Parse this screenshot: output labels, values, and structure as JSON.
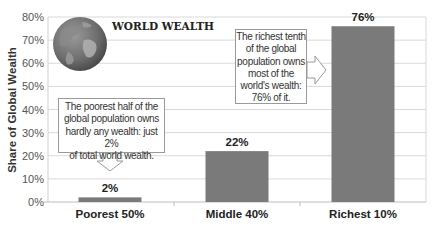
{
  "chart_data": {
    "type": "bar",
    "title": "WORLD WEALTH",
    "categories": [
      "Poorest 50%",
      "Middle 40%",
      "Richest 10%"
    ],
    "values": [
      2,
      22,
      76
    ],
    "value_labels": [
      "2%",
      "22%",
      "76%"
    ],
    "xlabel": "",
    "ylabel": "Share of Global Wealth",
    "ylim": [
      0,
      80
    ],
    "yticks": [
      "0%",
      "10%",
      "20%",
      "30%",
      "40%",
      "50%",
      "60%",
      "70%",
      "80%"
    ],
    "grid": true,
    "legend": null,
    "bar_color": "#7a7a7a",
    "annotations": [
      {
        "target": "Poorest 50%",
        "lines": [
          "The poorest half of the",
          "global population owns",
          "hardly any wealth: just  2%",
          "of total world wealth."
        ],
        "arrow": "down"
      },
      {
        "target": "Richest 10%",
        "lines": [
          "The richest tenth",
          "of the global",
          "population owns",
          "most of the",
          "world's wealth:",
          "76% of it."
        ],
        "arrow": "right"
      }
    ],
    "decoration": "globe-icon"
  }
}
